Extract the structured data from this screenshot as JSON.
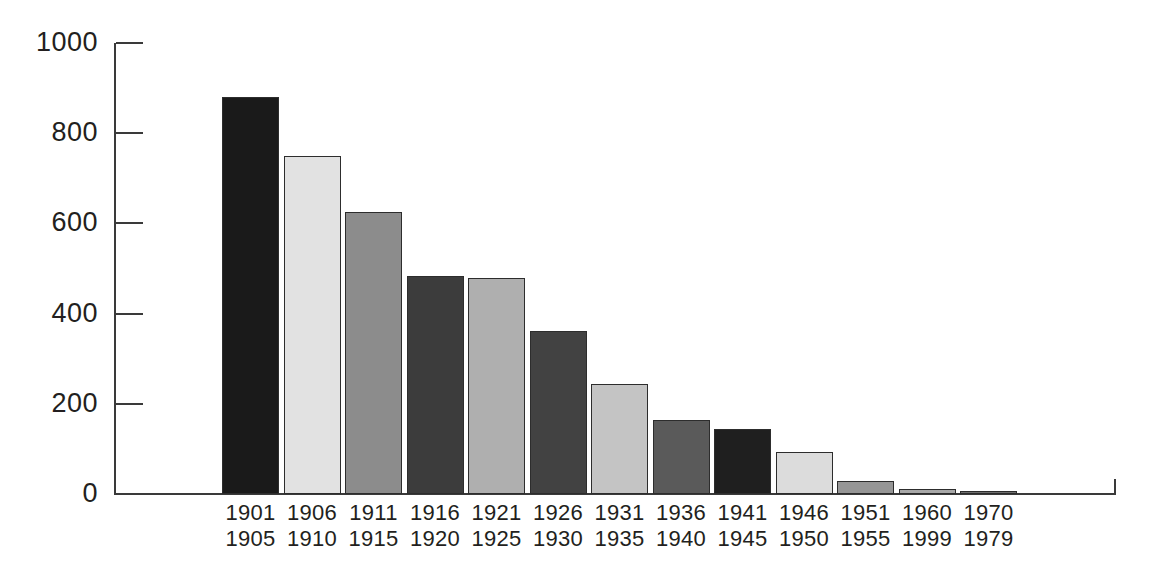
{
  "chart_data": {
    "type": "bar",
    "title": "",
    "subtitle": "",
    "xlabel": "",
    "ylabel": "",
    "categories": [
      "1901\n1905",
      "1906\n1910",
      "1911\n1915",
      "1916\n1920",
      "1921\n1925",
      "1926\n1930",
      "1931\n1935",
      "1936\n1940",
      "1941\n1945",
      "1946\n1950",
      "1951\n1955",
      "1960\n1999",
      "1970\n1979"
    ],
    "category_lines": [
      [
        "1901",
        "1905"
      ],
      [
        "1906",
        "1910"
      ],
      [
        "1911",
        "1915"
      ],
      [
        "1916",
        "1920"
      ],
      [
        "1921",
        "1925"
      ],
      [
        "1926",
        "1930"
      ],
      [
        "1931",
        "1935"
      ],
      [
        "1936",
        "1940"
      ],
      [
        "1941",
        "1945"
      ],
      [
        "1946",
        "1950"
      ],
      [
        "1951",
        "1955"
      ],
      [
        "1960",
        "1999"
      ],
      [
        "1970",
        "1979"
      ]
    ],
    "values": [
      880,
      750,
      625,
      483,
      478,
      362,
      245,
      164,
      144,
      94,
      29,
      11,
      7
    ],
    "bar_colors": [
      "#1a1a1a",
      "#e2e2e2",
      "#8c8c8c",
      "#3c3c3c",
      "#afafaf",
      "#424242",
      "#c4c4c4",
      "#5a5a5a",
      "#1f1f1f",
      "#dcdcdc",
      "#969696",
      "#a8a8a8",
      "#6e6e6e"
    ],
    "ylim": [
      0,
      1000
    ],
    "ytick_values": [
      0,
      200,
      400,
      600,
      800,
      1000
    ],
    "ytick_labels": [
      "0",
      "200",
      "400",
      "600",
      "800",
      "1000"
    ],
    "grid": false,
    "legend": null,
    "axis_color": "#3a3a3a",
    "text_color": "#231f20",
    "background": "#ffffff"
  }
}
